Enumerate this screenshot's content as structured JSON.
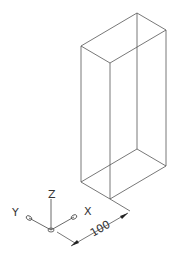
{
  "drawing": {
    "type": "isometric wireframe box",
    "dimension": {
      "value": "100"
    },
    "ucs_icon": {
      "x_label": "X",
      "y_label": "Y",
      "z_label": "Z"
    },
    "colors": {
      "line": "#555555",
      "background": "#ffffff"
    }
  }
}
